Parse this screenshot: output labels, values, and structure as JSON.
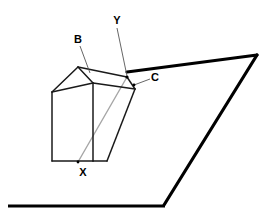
{
  "figure": {
    "canvas": {
      "width": 273,
      "height": 223,
      "background": "#ffffff"
    },
    "colors": {
      "outline": "#1a1a1a",
      "thick_outline": "#000000",
      "ray": "#a6a6a6",
      "leader": "#555555",
      "label_text": "#000000"
    },
    "labels": [
      {
        "id": "B",
        "text": "B",
        "x": 78,
        "y": 43,
        "font_size": 11
      },
      {
        "id": "Y",
        "text": "Y",
        "x": 117,
        "y": 24,
        "font_size": 11
      },
      {
        "id": "C",
        "text": "C",
        "x": 155,
        "y": 81,
        "font_size": 11
      },
      {
        "id": "X",
        "text": "X",
        "x": 83,
        "y": 176,
        "font_size": 11
      }
    ],
    "leader_lines": [
      {
        "id": "leader-B",
        "from": [
          80,
          46
        ],
        "to": [
          90,
          73
        ]
      },
      {
        "id": "leader-Y",
        "from": [
          117,
          28
        ],
        "to": [
          127,
          76
        ]
      },
      {
        "id": "leader-C",
        "from": [
          150,
          79
        ],
        "to": [
          134,
          85
        ]
      }
    ],
    "prism": {
      "apex_top": [
        78,
        67
      ],
      "apex_right": [
        127,
        77
      ],
      "left_top": [
        52,
        92
      ],
      "left_bottom": [
        52,
        161
      ],
      "mid_front_top": [
        93,
        83
      ],
      "mid_front_bottom": [
        93,
        161
      ],
      "right_face_top": [
        135,
        89
      ],
      "right_face_bottom": [
        107,
        161
      ],
      "edges": [
        {
          "id": "prism-edge-apex-left",
          "from": [
            78,
            67
          ],
          "to": [
            52,
            92
          ]
        },
        {
          "id": "prism-edge-apex-front",
          "from": [
            78,
            67
          ],
          "to": [
            93,
            83
          ]
        },
        {
          "id": "prism-edge-apex-back",
          "from": [
            78,
            67
          ],
          "to": [
            127,
            77
          ]
        },
        {
          "id": "prism-edge-left-front",
          "from": [
            52,
            92
          ],
          "to": [
            93,
            83
          ]
        },
        {
          "id": "prism-edge-left-vertical",
          "from": [
            52,
            92
          ],
          "to": [
            52,
            161
          ]
        },
        {
          "id": "prism-edge-front-vertical",
          "from": [
            93,
            83
          ],
          "to": [
            93,
            161
          ]
        },
        {
          "id": "prism-edge-bottom-left",
          "from": [
            52,
            161
          ],
          "to": [
            93,
            161
          ]
        },
        {
          "id": "prism-edge-front-to-right",
          "from": [
            93,
            83
          ],
          "to": [
            135,
            89
          ]
        },
        {
          "id": "prism-edge-top-back",
          "from": [
            127,
            77
          ],
          "to": [
            135,
            89
          ]
        },
        {
          "id": "prism-edge-right-slope",
          "from": [
            135,
            89
          ],
          "to": [
            107,
            161
          ]
        },
        {
          "id": "prism-edge-bottom-right",
          "from": [
            93,
            161
          ],
          "to": [
            107,
            161
          ]
        }
      ]
    },
    "ray": {
      "id": "ray-X-to-Y",
      "points": [
        [
          78,
          162
        ],
        [
          127,
          77
        ]
      ],
      "description": "light gray ray from X through prism to point Y"
    },
    "wedge": {
      "id": "wedge-surface",
      "points": [
        [
          127,
          72
        ],
        [
          257,
          55
        ],
        [
          164,
          205
        ]
      ],
      "description": "large thick-outlined wedge to the right"
    },
    "ground_line": {
      "id": "ground-line",
      "from": [
        8,
        206
      ],
      "to": [
        165,
        206
      ]
    }
  }
}
